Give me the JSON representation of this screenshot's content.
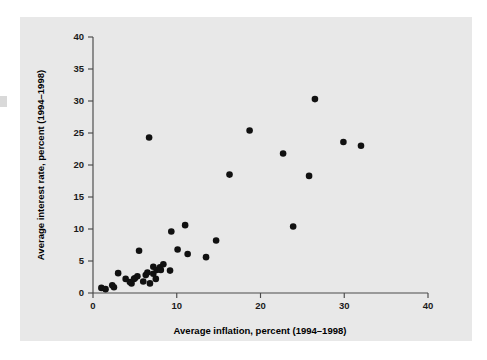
{
  "figure": {
    "background_color": "#ffffff",
    "panel_color": "#e8e8e8",
    "point_color": "#111111",
    "axis_color": "#4a4a4a"
  },
  "chart_data": {
    "type": "scatter",
    "title": "",
    "xlabel": "Average inflation, percent (1994–1998)",
    "ylabel": "Average interest rate, percent (1994–1998)",
    "xlim": [
      0,
      40
    ],
    "ylim": [
      0,
      40
    ],
    "xticks": [
      0,
      10,
      20,
      30,
      40
    ],
    "yticks": [
      0,
      5,
      10,
      15,
      20,
      25,
      30,
      35,
      40
    ],
    "xtick_labels": [
      "0",
      "10",
      "20",
      "30",
      "40"
    ],
    "ytick_labels": [
      "0",
      "5",
      "10",
      "15",
      "20",
      "25",
      "30",
      "35",
      "40"
    ],
    "grid": false,
    "legend": null,
    "series": [
      {
        "name": "countries",
        "marker": "filled-circle",
        "color": "#111111",
        "points": [
          {
            "x": 1.0,
            "y": 0.8
          },
          {
            "x": 1.5,
            "y": 0.6
          },
          {
            "x": 2.5,
            "y": 0.9
          },
          {
            "x": 2.3,
            "y": 1.2
          },
          {
            "x": 3.0,
            "y": 3.1
          },
          {
            "x": 3.9,
            "y": 2.2
          },
          {
            "x": 4.4,
            "y": 1.7
          },
          {
            "x": 4.6,
            "y": 1.5
          },
          {
            "x": 4.9,
            "y": 2.2
          },
          {
            "x": 5.0,
            "y": 2.3
          },
          {
            "x": 5.3,
            "y": 2.6
          },
          {
            "x": 5.5,
            "y": 6.6
          },
          {
            "x": 6.0,
            "y": 1.8
          },
          {
            "x": 6.3,
            "y": 2.8
          },
          {
            "x": 6.5,
            "y": 3.2
          },
          {
            "x": 6.7,
            "y": 24.3
          },
          {
            "x": 6.8,
            "y": 1.5
          },
          {
            "x": 7.2,
            "y": 3.0
          },
          {
            "x": 7.2,
            "y": 4.1
          },
          {
            "x": 7.5,
            "y": 2.2
          },
          {
            "x": 7.6,
            "y": 3.6
          },
          {
            "x": 8.0,
            "y": 4.0
          },
          {
            "x": 8.1,
            "y": 3.6
          },
          {
            "x": 8.4,
            "y": 4.5
          },
          {
            "x": 9.2,
            "y": 3.5
          },
          {
            "x": 9.35,
            "y": 9.6
          },
          {
            "x": 10.1,
            "y": 6.8
          },
          {
            "x": 11.0,
            "y": 10.6
          },
          {
            "x": 11.3,
            "y": 6.1
          },
          {
            "x": 13.5,
            "y": 5.6
          },
          {
            "x": 14.7,
            "y": 8.2
          },
          {
            "x": 16.3,
            "y": 18.5
          },
          {
            "x": 18.7,
            "y": 25.4
          },
          {
            "x": 22.7,
            "y": 21.8
          },
          {
            "x": 23.9,
            "y": 10.4
          },
          {
            "x": 25.8,
            "y": 18.3
          },
          {
            "x": 26.5,
            "y": 30.3
          },
          {
            "x": 29.9,
            "y": 23.6
          },
          {
            "x": 32.0,
            "y": 23.0
          }
        ]
      }
    ]
  }
}
